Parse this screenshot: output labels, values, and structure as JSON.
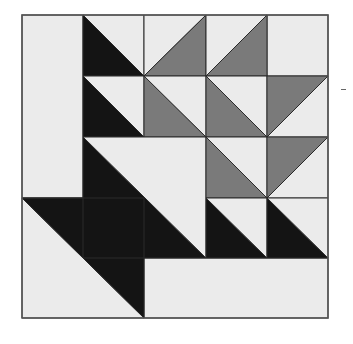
{
  "colors": {
    "background": "#ffffff",
    "light": "#ebebeb",
    "gray": "#7a7a7a",
    "dark": "#141414",
    "line": "#2a2a2a",
    "frame": "#555555"
  },
  "grid": {
    "x": [
      22,
      83,
      144,
      206,
      267,
      328
    ],
    "y": [
      15,
      76,
      137,
      198,
      258,
      318
    ],
    "rows": 5,
    "cols": 5
  },
  "rects": [
    {
      "name": "left-border-strip",
      "c0": 0,
      "r0": 0,
      "c1": 1,
      "r1": 3,
      "fill": "light"
    },
    {
      "name": "bottom-border-strip",
      "c0": 2,
      "r0": 4,
      "c1": 5,
      "r1": 5,
      "fill": "light"
    },
    {
      "name": "top-right-plain-square",
      "c0": 4,
      "r0": 0,
      "c1": 5,
      "r1": 1,
      "fill": "light"
    }
  ],
  "triangles": [
    {
      "name": "hst-r0-c1",
      "c0": 1,
      "r0": 0,
      "c1": 2,
      "r1": 1,
      "diag": "tlbr",
      "a": "dark",
      "b": "light"
    },
    {
      "name": "hst-r0-c2",
      "c0": 2,
      "r0": 0,
      "c1": 3,
      "r1": 1,
      "diag": "bltr",
      "a": "light",
      "b": "gray"
    },
    {
      "name": "hst-r0-c3",
      "c0": 3,
      "r0": 0,
      "c1": 4,
      "r1": 1,
      "diag": "bltr",
      "a": "light",
      "b": "gray"
    },
    {
      "name": "hst-r1-c1",
      "c0": 1,
      "r0": 1,
      "c1": 2,
      "r1": 2,
      "diag": "tlbr",
      "a": "dark",
      "b": "light"
    },
    {
      "name": "hst-r1-c2",
      "c0": 2,
      "r0": 1,
      "c1": 3,
      "r1": 2,
      "diag": "tlbr",
      "a": "gray",
      "b": "light"
    },
    {
      "name": "hst-r1-c3",
      "c0": 3,
      "r0": 1,
      "c1": 4,
      "r1": 2,
      "diag": "tlbr",
      "a": "gray",
      "b": "light"
    },
    {
      "name": "hst-r1-c4",
      "c0": 4,
      "r0": 1,
      "c1": 5,
      "r1": 2,
      "diag": "bltr",
      "a": "gray",
      "b": "light"
    },
    {
      "name": "large-hst-basket-body",
      "c0": 1,
      "r0": 2,
      "c1": 3,
      "r1": 4,
      "diag": "tlbr",
      "a": "dark",
      "b": "light"
    },
    {
      "name": "hst-r2-c3",
      "c0": 3,
      "r0": 2,
      "c1": 4,
      "r1": 3,
      "diag": "tlbr",
      "a": "gray",
      "b": "light"
    },
    {
      "name": "hst-r2-c4",
      "c0": 4,
      "r0": 2,
      "c1": 5,
      "r1": 3,
      "diag": "bltr",
      "a": "gray",
      "b": "light"
    },
    {
      "name": "hst-r3-c3",
      "c0": 3,
      "r0": 3,
      "c1": 4,
      "r1": 4,
      "diag": "tlbr",
      "a": "dark",
      "b": "light"
    },
    {
      "name": "hst-r3-c4",
      "c0": 4,
      "r0": 3,
      "c1": 5,
      "r1": 4,
      "diag": "tlbr",
      "a": "dark",
      "b": "light"
    },
    {
      "name": "large-hst-basket-base",
      "c0": 0,
      "r0": 3,
      "c1": 2,
      "r1": 5,
      "diag": "tlbr",
      "a": "light",
      "b": "dark"
    }
  ],
  "extra_lines": [
    {
      "name": "seam-r3-c1-vertical",
      "x1": 83,
      "y1": 198,
      "x2": 83,
      "y2": 258
    },
    {
      "name": "seam-r4-horizontal",
      "x1": 83,
      "y1": 258,
      "x2": 144,
      "y2": 258
    },
    {
      "name": "seam-r3-top-left",
      "x1": 22,
      "y1": 198,
      "x2": 83,
      "y2": 198
    }
  ],
  "marks": [
    {
      "name": "stray-dash-mark",
      "x": 341,
      "y": 89,
      "w": 5,
      "h": 1
    }
  ]
}
